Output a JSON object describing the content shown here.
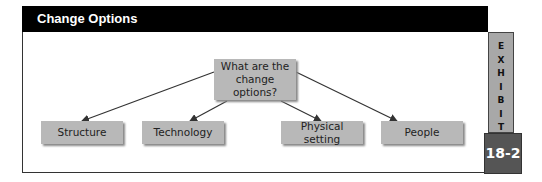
{
  "header": {
    "title": "Change Options"
  },
  "diagram": {
    "root": {
      "label": "What are the change options?",
      "line1": "What are the",
      "line2": "change options?"
    },
    "children": [
      {
        "label": "Structure"
      },
      {
        "label": "Technology"
      },
      {
        "label": "Physical setting"
      },
      {
        "label": "People"
      }
    ]
  },
  "exhibit": {
    "label_letters": [
      "E",
      "X",
      "H",
      "I",
      "B",
      "I",
      "T"
    ],
    "number": "18-2"
  },
  "colors": {
    "header_bg": "#000000",
    "box_fill": "#b8b8b8",
    "exhibit_col": "#a8a8a8",
    "exhibit_num_bg": "#555555"
  }
}
